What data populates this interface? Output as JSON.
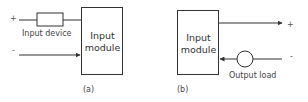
{
  "diagram_a": {
    "plus": "+",
    "minus": "-",
    "device_label": "Input device",
    "module_line1": "Input",
    "module_line2": "module",
    "caption": "(a)"
  },
  "diagram_b": {
    "plus": "+",
    "minus": "-",
    "load_label": "Output load",
    "module_line1": "Input",
    "module_line2": "module",
    "caption": "(b)"
  },
  "colors": {
    "line": "#333333",
    "text": "#444444"
  }
}
